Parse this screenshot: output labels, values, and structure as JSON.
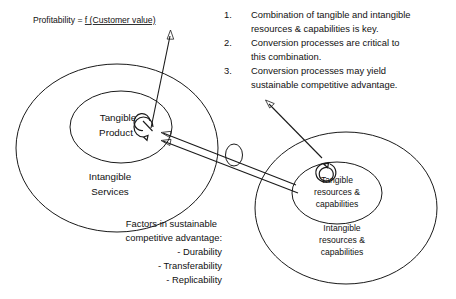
{
  "diagram": {
    "title_formula": {
      "prefix": "Profitability = ",
      "underlined": "f (Customer value)",
      "full": "Profitability = f (Customer value)"
    },
    "left_group": {
      "inner_label_line1": "Tangible",
      "inner_label_line2": "Product",
      "outer_label_line1": "Intangible",
      "outer_label_line2": "Services"
    },
    "right_group": {
      "inner_label_line1": "Tangible",
      "inner_label_line2": "resources &",
      "inner_label_line3": "capabilities",
      "outer_label_line1": "Intangible",
      "outer_label_line2": "resources &",
      "outer_label_line3": "capabilities"
    },
    "numbered_list": [
      {
        "number": "1.",
        "lines": [
          "Combination of tangible and intangible",
          "resources & capabilities is key."
        ]
      },
      {
        "number": "2.",
        "lines": [
          "Conversion processes are critical to",
          "this combination."
        ]
      },
      {
        "number": "3.",
        "lines": [
          "Conversion processes may yield",
          "sustainable competitive advantage."
        ]
      }
    ],
    "factors_block": {
      "heading_line1": "Factors in sustainable",
      "heading_line2": "competitive  advantage:",
      "items": [
        "- Durability",
        "- Transferability",
        "- Replicability"
      ]
    },
    "colors": {
      "stroke": "#1a1a1a",
      "text": "#111111",
      "background": "#ffffff"
    }
  }
}
